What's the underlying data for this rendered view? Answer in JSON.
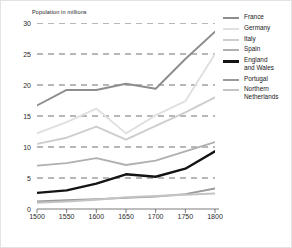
{
  "chart_data": {
    "type": "line",
    "title": "",
    "ylabel": "Population in millions",
    "xlabel": "",
    "x": [
      1500,
      1550,
      1600,
      1650,
      1700,
      1750,
      1800
    ],
    "xticklabels": [
      "1500",
      "1550",
      "1600",
      "1650",
      "1700",
      "1750",
      "1800"
    ],
    "yticklabels": [
      "0",
      "5",
      "10",
      "15",
      "20",
      "25",
      "30"
    ],
    "ylim": [
      0,
      30
    ],
    "xlim": [
      1500,
      1800
    ],
    "grid": "horizontal-dashed",
    "legend_position": "right",
    "series": [
      {
        "name": "France",
        "values": [
          16.7,
          19.2,
          19.2,
          20.2,
          19.4,
          24.2,
          28.6
        ],
        "color": "#8d8d8d",
        "width": 1.9
      },
      {
        "name": "Germany",
        "values": [
          12.2,
          14.0,
          16.2,
          12.2,
          15.1,
          17.4,
          25.0
        ],
        "color": "#e0e0e0",
        "width": 1.9
      },
      {
        "name": "Italy",
        "values": [
          10.5,
          11.5,
          13.3,
          11.2,
          13.4,
          15.6,
          18.0
        ],
        "color": "#cdcdcd",
        "width": 1.9
      },
      {
        "name": "Spain",
        "values": [
          7.0,
          7.4,
          8.2,
          7.1,
          7.8,
          9.3,
          10.8
        ],
        "color": "#b0b0b0",
        "width": 1.9
      },
      {
        "name": "England\nand Wales",
        "values": [
          2.6,
          3.0,
          4.1,
          5.6,
          5.2,
          6.5,
          9.3
        ],
        "color": "#141414",
        "width": 2.4
      },
      {
        "name": "Portugal",
        "values": [
          1.2,
          1.4,
          1.6,
          1.8,
          2.0,
          2.4,
          3.3
        ],
        "color": "#9a9a9a",
        "width": 1.9
      },
      {
        "name": "Northern\nNetherlands",
        "values": [
          1.0,
          1.2,
          1.5,
          1.9,
          2.1,
          2.3,
          2.5
        ],
        "color": "#c4c4c4",
        "width": 1.9
      }
    ]
  }
}
